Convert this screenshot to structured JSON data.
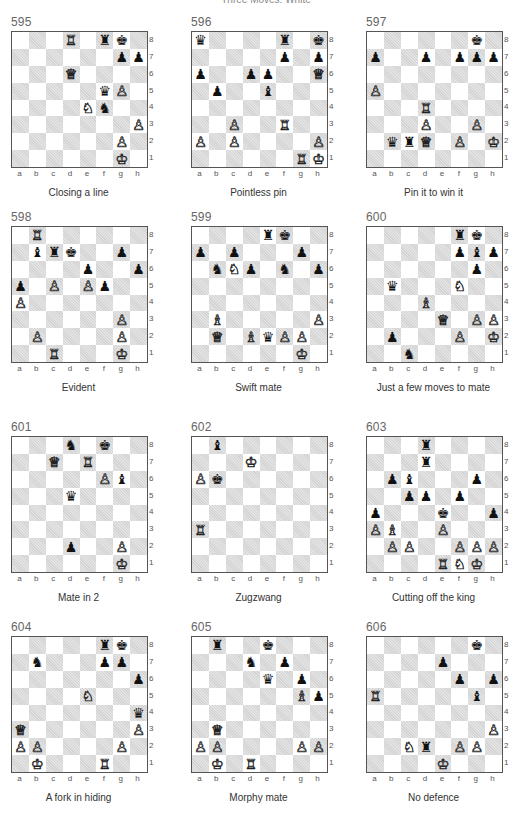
{
  "header": {
    "title": "Three Moves: White"
  },
  "files": [
    "a",
    "b",
    "c",
    "d",
    "e",
    "f",
    "g",
    "h"
  ],
  "ranks": [
    "8",
    "7",
    "6",
    "5",
    "4",
    "3",
    "2",
    "1"
  ],
  "glyphs": {
    "K": "♔",
    "Q": "♕",
    "R": "♖",
    "B": "♗",
    "N": "♘",
    "P": "♙",
    "k": "♚",
    "q": "♛",
    "r": "♜",
    "b": "♝",
    "n": "♞",
    "p": "♟"
  },
  "puzzles": [
    {
      "number": "595",
      "caption": "Closing a line",
      "pieces": {
        "d8": "R",
        "f8": "r",
        "g8": "k",
        "g7": "p",
        "h7": "p",
        "d6": "Q",
        "f5": "q",
        "g5": "P",
        "e4": "N",
        "f4": "n",
        "h3": "P",
        "g2": "P",
        "g1": "K"
      }
    },
    {
      "number": "596",
      "caption": "Pointless pin",
      "pieces": {
        "a8": "q",
        "f8": "r",
        "h8": "k",
        "f7": "p",
        "h7": "p",
        "a6": "p",
        "d6": "p",
        "e6": "p",
        "h6": "Q",
        "b5": "p",
        "e5": "b",
        "c3": "P",
        "f3": "R",
        "a2": "P",
        "c2": "P",
        "h2": "P",
        "g1": "R",
        "h1": "K"
      }
    },
    {
      "number": "597",
      "caption": "Pin it to win it",
      "pieces": {
        "g8": "k",
        "a7": "p",
        "d7": "p",
        "f7": "p",
        "g7": "p",
        "h7": "p",
        "a5": "P",
        "d4": "R",
        "d3": "P",
        "g3": "P",
        "b2": "q",
        "c2": "r",
        "d2": "Q",
        "f2": "P",
        "h2": "K"
      }
    },
    {
      "number": "598",
      "caption": "Evident",
      "pieces": {
        "b8": "R",
        "b7": "b",
        "c7": "r",
        "d7": "k",
        "g7": "p",
        "e6": "p",
        "h6": "p",
        "a5": "p",
        "c5": "P",
        "e5": "P",
        "f5": "p",
        "a4": "P",
        "g3": "P",
        "b2": "P",
        "g2": "P",
        "c1": "R",
        "g1": "K"
      }
    },
    {
      "number": "599",
      "caption": "Swift mate",
      "pieces": {
        "e8": "r",
        "f8": "k",
        "a7": "p",
        "c7": "p",
        "g7": "p",
        "b6": "n",
        "c6": "N",
        "d6": "p",
        "f6": "n",
        "h6": "p",
        "b3": "B",
        "h3": "P",
        "b2": "Q",
        "d2": "B",
        "e2": "q",
        "f2": "P",
        "g2": "P",
        "g1": "K"
      }
    },
    {
      "number": "600",
      "caption": "Just a few moves to mate",
      "pieces": {
        "f8": "r",
        "g8": "k",
        "f7": "p",
        "g7": "b",
        "h7": "p",
        "g6": "p",
        "b5": "q",
        "f5": "N",
        "d4": "B",
        "e3": "Q",
        "g3": "P",
        "h3": "P",
        "b2": "p",
        "f2": "P",
        "h2": "K",
        "c1": "n"
      }
    },
    {
      "number": "601",
      "caption": "Mate in 2",
      "pieces": {
        "d8": "n",
        "f8": "k",
        "c7": "Q",
        "e7": "R",
        "f6": "P",
        "g6": "b",
        "d5": "q",
        "d2": "p",
        "g2": "P",
        "g1": "K"
      }
    },
    {
      "number": "602",
      "caption": "Zugzwang",
      "pieces": {
        "b8": "b",
        "d7": "K",
        "a6": "P",
        "b6": "k",
        "a3": "R"
      }
    },
    {
      "number": "603",
      "caption": "Cutting off the king",
      "pieces": {
        "d8": "r",
        "d7": "r",
        "b6": "p",
        "c6": "b",
        "g6": "p",
        "c5": "p",
        "d5": "p",
        "f5": "p",
        "a4": "p",
        "e4": "k",
        "h4": "p",
        "a3": "P",
        "b3": "B",
        "e3": "P",
        "b2": "P",
        "c2": "P",
        "f2": "P",
        "g2": "P",
        "h2": "P",
        "e1": "R",
        "f1": "N",
        "g1": "K"
      }
    },
    {
      "number": "604",
      "caption": "A fork in hiding",
      "pieces": {
        "f8": "r",
        "g8": "k",
        "b7": "n",
        "f7": "p",
        "g7": "p",
        "h6": "p",
        "e5": "N",
        "h4": "q",
        "a3": "Q",
        "h3": "P",
        "a2": "P",
        "b2": "P",
        "g2": "P",
        "b1": "K",
        "f1": "R"
      }
    },
    {
      "number": "605",
      "caption": "Morphy mate",
      "pieces": {
        "b8": "r",
        "e8": "k",
        "d7": "n",
        "f7": "p",
        "e6": "q",
        "g6": "p",
        "g5": "B",
        "h5": "p",
        "b3": "Q",
        "a2": "P",
        "b2": "P",
        "g2": "P",
        "h2": "P",
        "b1": "K",
        "d1": "R"
      }
    },
    {
      "number": "606",
      "caption": "No defence",
      "pieces": {
        "g8": "k",
        "e7": "p",
        "f6": "p",
        "h6": "p",
        "a5": "R",
        "g5": "b",
        "h3": "P",
        "c2": "N",
        "d2": "r",
        "f2": "P",
        "g2": "P",
        "e1": "K"
      }
    }
  ]
}
